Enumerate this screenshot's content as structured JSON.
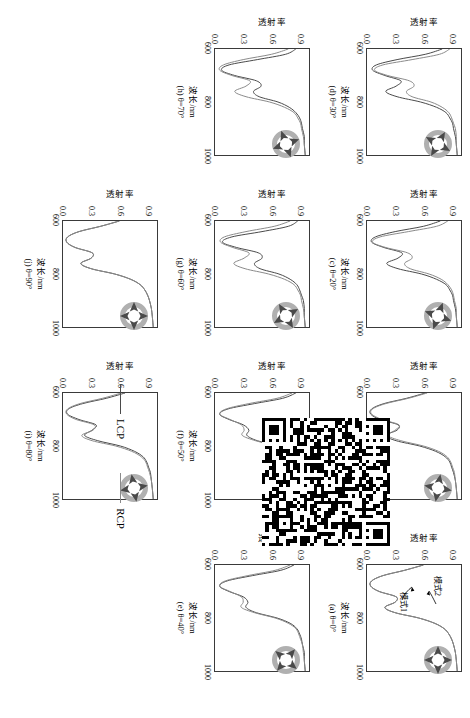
{
  "figure": {
    "axis": {
      "xlabel": "波长/nm",
      "ylabel": "透射率",
      "xticks": [
        "600",
        "800",
        "1000"
      ],
      "yticks": [
        "0.0",
        "0.3",
        "0.6",
        "0.9"
      ],
      "xlim": [
        600,
        1000
      ],
      "ylim": [
        0.0,
        1.0
      ]
    },
    "legend": {
      "lcp_label": "LCP",
      "rcp_label": "RCP",
      "lcp_color": "#4a4a4a",
      "rcp_color": "#8a8a8a"
    },
    "annotations": {
      "mode1": "模式1",
      "mode2": "模式2"
    },
    "qr": {
      "name": "qr-code"
    }
  },
  "chart_data": {
    "type": "line",
    "title": "",
    "xlabel": "波长/nm",
    "ylabel": "透射率",
    "xlim": [
      600,
      1000
    ],
    "ylim": [
      0.0,
      1.0
    ],
    "grid": false,
    "legend_position": "bottom-right",
    "x": [
      600,
      620,
      640,
      660,
      680,
      700,
      720,
      740,
      760,
      780,
      800,
      820,
      840,
      860,
      880,
      900,
      930,
      960,
      1000
    ],
    "panels": [
      {
        "id": "a",
        "caption": "(a) θ=0°",
        "theta": 0,
        "series": [
          {
            "name": "LCP",
            "values": [
              0.6,
              0.4,
              0.17,
              0.05,
              0.04,
              0.13,
              0.31,
              0.3,
              0.19,
              0.3,
              0.55,
              0.72,
              0.82,
              0.87,
              0.9,
              0.92,
              0.94,
              0.95,
              0.96
            ]
          },
          {
            "name": "RCP",
            "values": [
              0.6,
              0.4,
              0.17,
              0.05,
              0.04,
              0.13,
              0.31,
              0.3,
              0.19,
              0.3,
              0.55,
              0.72,
              0.82,
              0.87,
              0.9,
              0.92,
              0.94,
              0.95,
              0.96
            ]
          }
        ]
      },
      {
        "id": "b",
        "caption": "(b) θ=10°",
        "theta": 10,
        "series": [
          {
            "name": "LCP",
            "values": [
              0.62,
              0.42,
              0.18,
              0.05,
              0.04,
              0.14,
              0.33,
              0.32,
              0.2,
              0.31,
              0.56,
              0.73,
              0.83,
              0.88,
              0.9,
              0.92,
              0.94,
              0.95,
              0.96
            ]
          },
          {
            "name": "RCP",
            "values": [
              0.64,
              0.44,
              0.2,
              0.06,
              0.05,
              0.16,
              0.34,
              0.3,
              0.22,
              0.36,
              0.6,
              0.76,
              0.85,
              0.89,
              0.91,
              0.93,
              0.94,
              0.95,
              0.96
            ]
          }
        ]
      },
      {
        "id": "c",
        "caption": "(c) θ=20°",
        "theta": 20,
        "series": [
          {
            "name": "LCP",
            "values": [
              0.78,
              0.6,
              0.3,
              0.09,
              0.05,
              0.18,
              0.37,
              0.33,
              0.21,
              0.33,
              0.58,
              0.74,
              0.84,
              0.88,
              0.91,
              0.92,
              0.94,
              0.95,
              0.96
            ]
          },
          {
            "name": "RCP",
            "values": [
              0.86,
              0.74,
              0.44,
              0.14,
              0.06,
              0.2,
              0.43,
              0.48,
              0.4,
              0.46,
              0.66,
              0.79,
              0.86,
              0.9,
              0.92,
              0.93,
              0.95,
              0.95,
              0.96
            ]
          }
        ]
      },
      {
        "id": "d",
        "caption": "(d) θ=30°",
        "theta": 30,
        "series": [
          {
            "name": "LCP",
            "values": [
              0.8,
              0.62,
              0.32,
              0.1,
              0.06,
              0.19,
              0.36,
              0.31,
              0.2,
              0.32,
              0.57,
              0.74,
              0.84,
              0.88,
              0.91,
              0.92,
              0.94,
              0.95,
              0.96
            ]
          },
          {
            "name": "RCP",
            "values": [
              0.88,
              0.77,
              0.48,
              0.17,
              0.08,
              0.22,
              0.45,
              0.5,
              0.42,
              0.48,
              0.68,
              0.8,
              0.87,
              0.9,
              0.92,
              0.94,
              0.95,
              0.95,
              0.96
            ]
          }
        ]
      },
      {
        "id": "e",
        "caption": "(e) θ=40°",
        "theta": 40,
        "series": [
          {
            "name": "LCP",
            "values": [
              0.84,
              0.7,
              0.4,
              0.13,
              0.05,
              0.15,
              0.3,
              0.35,
              0.33,
              0.44,
              0.66,
              0.8,
              0.87,
              0.9,
              0.92,
              0.93,
              0.95,
              0.95,
              0.96
            ]
          },
          {
            "name": "RCP",
            "values": [
              0.8,
              0.64,
              0.35,
              0.11,
              0.05,
              0.16,
              0.28,
              0.3,
              0.28,
              0.42,
              0.64,
              0.78,
              0.86,
              0.89,
              0.91,
              0.93,
              0.94,
              0.95,
              0.96
            ]
          }
        ]
      },
      {
        "id": "f",
        "caption": "(f) θ=50°",
        "theta": 50,
        "series": [
          {
            "name": "LCP",
            "values": [
              0.86,
              0.72,
              0.42,
              0.14,
              0.05,
              0.15,
              0.3,
              0.36,
              0.34,
              0.45,
              0.67,
              0.8,
              0.87,
              0.9,
              0.92,
              0.94,
              0.95,
              0.95,
              0.96
            ]
          },
          {
            "name": "RCP",
            "values": [
              0.82,
              0.66,
              0.36,
              0.12,
              0.05,
              0.16,
              0.28,
              0.31,
              0.29,
              0.43,
              0.65,
              0.79,
              0.86,
              0.89,
              0.92,
              0.93,
              0.94,
              0.95,
              0.96
            ]
          }
        ]
      },
      {
        "id": "g",
        "caption": "(g) θ=60°",
        "theta": 60,
        "series": [
          {
            "name": "LCP",
            "values": [
              0.88,
              0.78,
              0.5,
              0.18,
              0.08,
              0.23,
              0.46,
              0.5,
              0.42,
              0.48,
              0.68,
              0.8,
              0.87,
              0.9,
              0.92,
              0.94,
              0.95,
              0.95,
              0.96
            ]
          },
          {
            "name": "RCP",
            "values": [
              0.8,
              0.63,
              0.33,
              0.1,
              0.06,
              0.19,
              0.36,
              0.31,
              0.2,
              0.32,
              0.57,
              0.74,
              0.84,
              0.88,
              0.91,
              0.92,
              0.94,
              0.95,
              0.96
            ]
          }
        ]
      },
      {
        "id": "h",
        "caption": "(h) θ=70°",
        "theta": 70,
        "series": [
          {
            "name": "LCP",
            "values": [
              0.86,
              0.75,
              0.45,
              0.15,
              0.07,
              0.21,
              0.44,
              0.49,
              0.41,
              0.47,
              0.67,
              0.79,
              0.86,
              0.9,
              0.92,
              0.93,
              0.95,
              0.95,
              0.96
            ]
          },
          {
            "name": "RCP",
            "values": [
              0.78,
              0.6,
              0.3,
              0.09,
              0.05,
              0.18,
              0.37,
              0.33,
              0.21,
              0.33,
              0.58,
              0.74,
              0.84,
              0.88,
              0.91,
              0.92,
              0.94,
              0.95,
              0.96
            ]
          }
        ]
      },
      {
        "id": "i",
        "caption": "(i) θ=80°",
        "theta": 80,
        "series": [
          {
            "name": "LCP",
            "values": [
              0.66,
              0.46,
              0.21,
              0.06,
              0.05,
              0.17,
              0.35,
              0.31,
              0.23,
              0.37,
              0.61,
              0.76,
              0.85,
              0.89,
              0.91,
              0.93,
              0.94,
              0.95,
              0.96
            ]
          },
          {
            "name": "RCP",
            "values": [
              0.62,
              0.42,
              0.18,
              0.05,
              0.04,
              0.14,
              0.33,
              0.32,
              0.2,
              0.31,
              0.56,
              0.73,
              0.83,
              0.88,
              0.9,
              0.92,
              0.94,
              0.95,
              0.96
            ]
          }
        ]
      },
      {
        "id": "j",
        "caption": "(j) θ=90°",
        "theta": 90,
        "series": [
          {
            "name": "LCP",
            "values": [
              0.6,
              0.4,
              0.17,
              0.05,
              0.04,
              0.13,
              0.31,
              0.3,
              0.19,
              0.3,
              0.55,
              0.72,
              0.82,
              0.87,
              0.9,
              0.92,
              0.94,
              0.95,
              0.96
            ]
          },
          {
            "name": "RCP",
            "values": [
              0.6,
              0.4,
              0.17,
              0.05,
              0.04,
              0.13,
              0.31,
              0.3,
              0.19,
              0.3,
              0.55,
              0.72,
              0.82,
              0.87,
              0.9,
              0.92,
              0.94,
              0.95,
              0.96
            ]
          }
        ]
      }
    ]
  }
}
